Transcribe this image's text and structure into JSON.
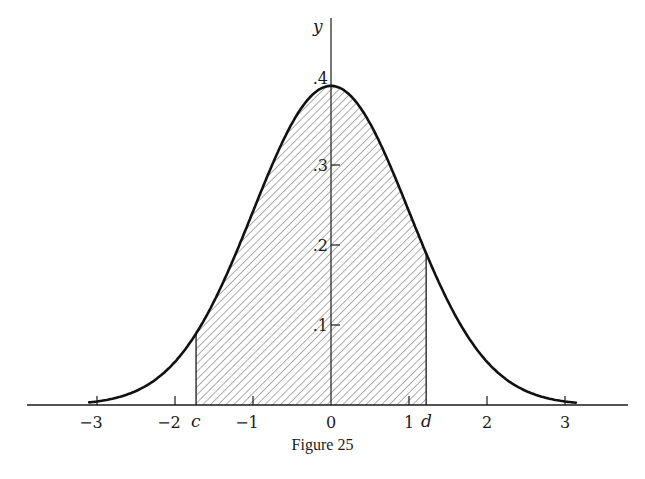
{
  "caption": "Figure 25",
  "axes": {
    "y_label": "y",
    "x_tick_labels": [
      "−3",
      "−2",
      "−1",
      "0",
      "1",
      "2",
      "3"
    ],
    "y_tick_labels": [
      ".1",
      ".2",
      ".3",
      ".4"
    ],
    "c_label": "c",
    "d_label": "d"
  },
  "chart_data": {
    "type": "area",
    "title": "Figure 25",
    "function": "y = (1/sqrt(2*pi)) * exp(-x^2/2)",
    "xlabel": "",
    "ylabel": "y",
    "xlim": [
      -3.9,
      3.8
    ],
    "ylim": [
      0,
      0.42
    ],
    "x_ticks": [
      -3,
      -2,
      -1,
      0,
      1,
      2,
      3
    ],
    "y_ticks": [
      0.1,
      0.2,
      0.3,
      0.4
    ],
    "x": [
      -3.0,
      -2.5,
      -2.0,
      -1.5,
      -1.0,
      -0.5,
      0.0,
      0.5,
      1.0,
      1.5,
      2.0,
      2.5,
      3.0
    ],
    "values": [
      0.0044,
      0.0175,
      0.054,
      0.1295,
      0.242,
      0.3521,
      0.3989,
      0.3521,
      0.242,
      0.1295,
      0.054,
      0.0175,
      0.0044
    ],
    "shaded_region": {
      "from_label": "c",
      "from": -1.73,
      "to_label": "d",
      "to": 1.22,
      "style": "diagonal hatch"
    },
    "annotations": [
      "c",
      "d"
    ],
    "grid": false,
    "legend": null
  }
}
